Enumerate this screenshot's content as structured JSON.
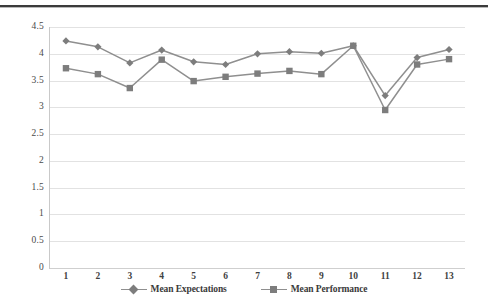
{
  "chart_data": {
    "type": "line",
    "title": "",
    "xlabel": "",
    "ylabel": "",
    "categories": [
      "1",
      "2",
      "3",
      "4",
      "5",
      "6",
      "7",
      "8",
      "9",
      "10",
      "11",
      "12",
      "13"
    ],
    "series": [
      {
        "name": "Mean Expectations",
        "marker": "diamond",
        "color": "#7d7d7d",
        "values": [
          4.24,
          4.13,
          3.83,
          4.07,
          3.85,
          3.8,
          4.0,
          4.04,
          4.01,
          4.15,
          3.22,
          3.93,
          4.08
        ]
      },
      {
        "name": "Mean Performance",
        "marker": "square",
        "color": "#7d7d7d",
        "values": [
          3.73,
          3.62,
          3.36,
          3.89,
          3.49,
          3.57,
          3.63,
          3.68,
          3.62,
          4.15,
          2.95,
          3.8,
          3.9
        ]
      }
    ],
    "ylim": [
      0,
      4.5
    ],
    "ytick_step": 0.5,
    "yticks": [
      "0",
      "0.5",
      "1",
      "1.5",
      "2",
      "2.5",
      "3",
      "3.5",
      "4",
      "4.5"
    ],
    "grid": true,
    "legend_position": "bottom",
    "line_color": "#8f8f8f",
    "gridline_color": "#e2e2e2",
    "axis_color": "#c9c9c9"
  },
  "legend": {
    "entries": [
      {
        "label": "Mean Expectations",
        "marker": "diamond"
      },
      {
        "label": "Mean Performance",
        "marker": "square"
      }
    ]
  }
}
